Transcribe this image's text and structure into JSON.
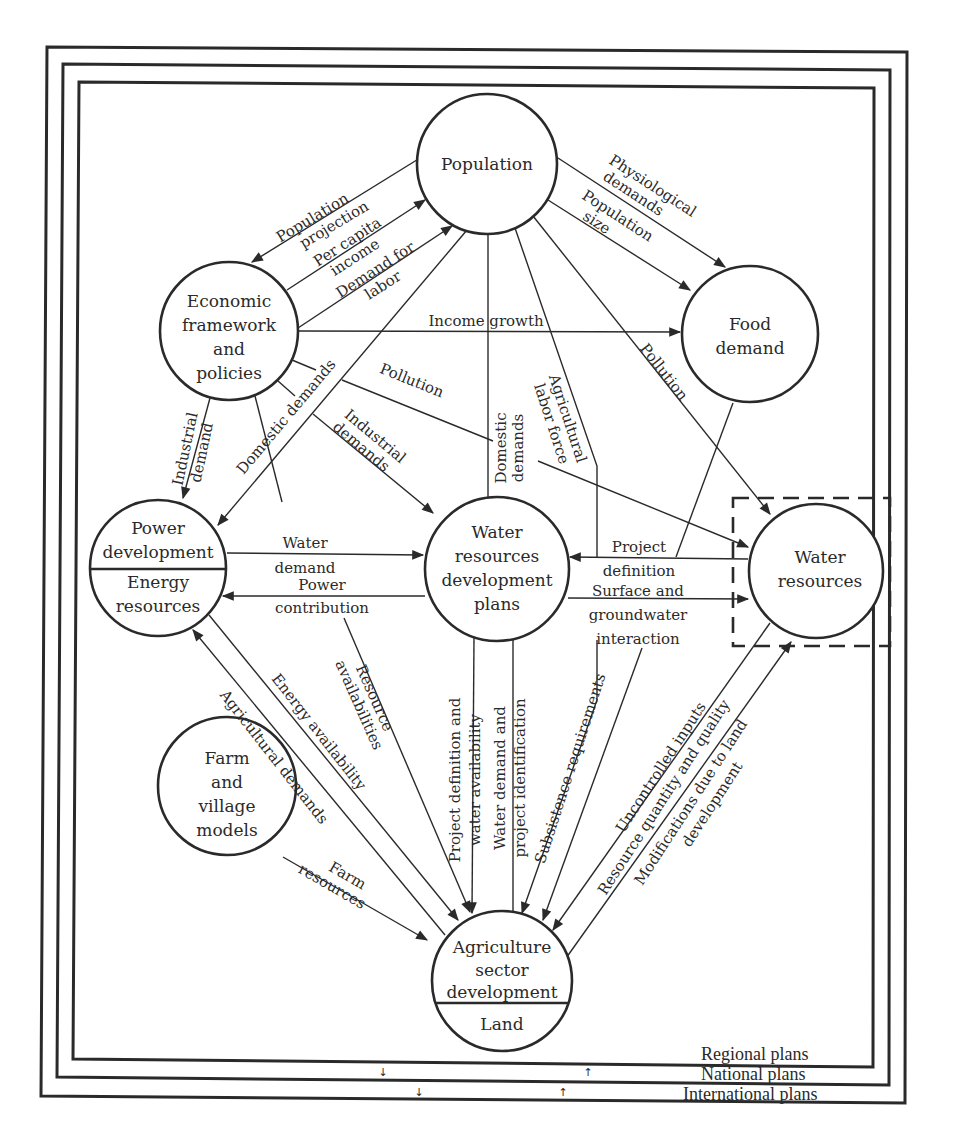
{
  "nodes": {
    "population": {
      "lines": [
        "Population"
      ]
    },
    "economic": {
      "lines": [
        "Economic",
        "framework",
        "and",
        "policies"
      ]
    },
    "food": {
      "lines": [
        "Food",
        "demand"
      ]
    },
    "power": {
      "top": [
        "Power",
        "development"
      ],
      "bottom": [
        "Energy",
        "resources"
      ]
    },
    "wrdp": {
      "lines": [
        "Water",
        "resources",
        "development",
        "plans"
      ]
    },
    "water_resources": {
      "lines": [
        "Water",
        "resources"
      ]
    },
    "farm": {
      "lines": [
        "Farm",
        "and",
        "village",
        "models"
      ]
    },
    "agriculture": {
      "top": [
        "Agriculture",
        "sector",
        "development"
      ],
      "bottom": [
        "Land"
      ]
    }
  },
  "edges": {
    "population_projection": [
      "Population",
      "projection"
    ],
    "per_capita_income": [
      "Per capita",
      "income"
    ],
    "demand_for_labor": [
      "Demand for",
      "labor"
    ],
    "physiological_demands": [
      "Physiological",
      "demands"
    ],
    "population_size": [
      "Population",
      "size"
    ],
    "income_growth": "Income growth",
    "industrial_demand": [
      "Industrial",
      "demand"
    ],
    "domestic_demands_power": "Domestic demands",
    "pollution_center": "Pollution",
    "industrial_demands": [
      "Industrial",
      "demands"
    ],
    "domestic_demands_wr": [
      "Domestic",
      "demands"
    ],
    "agricultural_labor_force": [
      "Agricultural",
      "labor force"
    ],
    "pollution_right": "Pollution",
    "water_demand": [
      "Water",
      "demand"
    ],
    "power_contribution": [
      "Power",
      "contribution"
    ],
    "project_definition": [
      "Project",
      "definition"
    ],
    "surface_groundwater": [
      "Surface and",
      "groundwater",
      "interaction"
    ],
    "energy_availability": "Energy availability",
    "agricultural_demands": "Agricultural demands",
    "resource_availabilities": [
      "Resource",
      "availabilities"
    ],
    "project_def_water_avail": [
      "Project definition and",
      "water availability"
    ],
    "water_demand_project_id": [
      "Water demand and",
      "project identification"
    ],
    "subsistence_requirements": "Subsistence requirements",
    "uncontrolled_inputs": "Uncontrolled inputs",
    "resource_quantity_quality": "Resource quantity and quality",
    "modifications_land": [
      "Modifications due to land",
      "development"
    ],
    "farm_resources": [
      "Farm",
      "resources"
    ]
  },
  "plans": {
    "regional": "Regional plans",
    "national": "National plans",
    "international": "International plans",
    "down_arrow": "↓",
    "up_arrow": "↑"
  }
}
